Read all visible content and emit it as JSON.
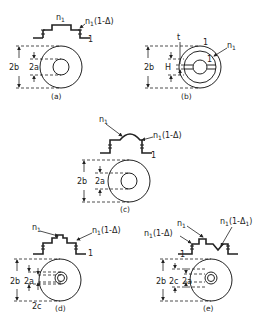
{
  "figure": {
    "panels": [
      {
        "id": "a",
        "caption": "(a)",
        "index_labels": {
          "core": "n",
          "core_sub": "1",
          "cladding": "n",
          "cladding_sub": "1",
          "cladding_suffix": "(1-Δ)",
          "outer": "1"
        },
        "dimensions": {
          "outer": "2b",
          "core": "2a"
        }
      },
      {
        "id": "b",
        "caption": "(b)",
        "index_labels": {
          "top": "t",
          "ring": "1",
          "n": "n",
          "n_sub": "1",
          "inner": "1"
        },
        "dimensions": {
          "outer": "2b",
          "slot": "H"
        }
      },
      {
        "id": "c",
        "caption": "(c)",
        "index_labels": {
          "core": "n",
          "core_sub": "1",
          "cladding": "n",
          "cladding_sub": "1",
          "cladding_suffix": "(1-Δ)",
          "outer": "1"
        },
        "dimensions": {
          "outer": "2b",
          "core": "2a"
        }
      },
      {
        "id": "d",
        "caption": "(d)",
        "index_labels": {
          "core": "n",
          "core_sub": "1",
          "cladding": "n",
          "cladding_sub": "1",
          "cladding_suffix": "(1-Δ)",
          "outer": "1"
        },
        "dimensions": {
          "outer": "2b",
          "core": "2a",
          "inner": "2c"
        }
      },
      {
        "id": "e",
        "caption": "(e)",
        "index_labels": {
          "left": "n",
          "left_sub": "1",
          "left_suffix": "(1-Δ)",
          "core": "n",
          "core_sub": "1",
          "right": "n",
          "right_sub": "1",
          "right_suffix": "(1-Δ",
          "right_suffix_sub": "1",
          "right_close": ")",
          "outer": "1"
        },
        "dimensions": {
          "outer": "2b",
          "mid": "2c",
          "core": "2a"
        }
      }
    ]
  }
}
